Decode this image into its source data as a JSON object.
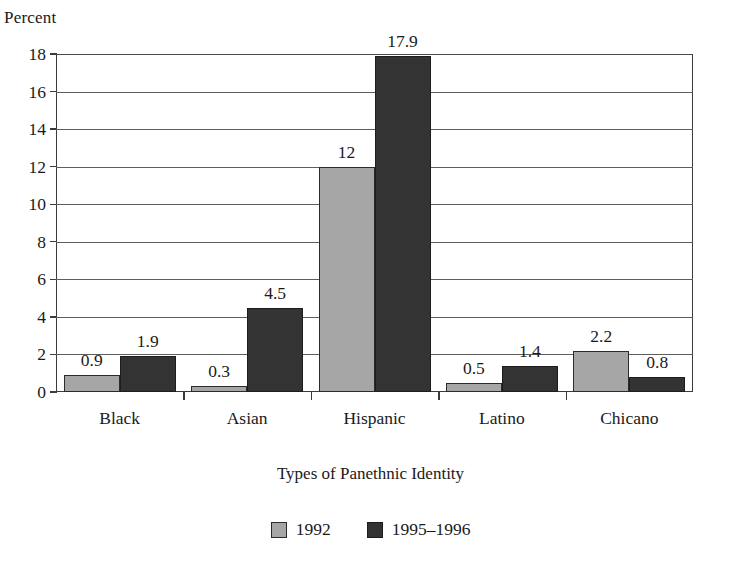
{
  "chart_data": {
    "type": "bar",
    "title": "",
    "xlabel": "Types of Panethnic Identity",
    "ylabel": "Percent",
    "categories": [
      "Black",
      "Asian",
      "Hispanic",
      "Latino",
      "Chicano"
    ],
    "series": [
      {
        "name": "1992",
        "color": "#a6a6a6",
        "values": [
          0.9,
          0.3,
          12,
          0.5,
          2.2
        ],
        "labels": [
          "0.9",
          "0.3",
          "12",
          "0.5",
          "2.2"
        ]
      },
      {
        "name": "1995–1996",
        "color": "#333333",
        "values": [
          1.9,
          4.5,
          17.9,
          1.4,
          0.8
        ],
        "labels": [
          "1.9",
          "4.5",
          "17.9",
          "1.4",
          "0.8"
        ]
      }
    ],
    "ylim": [
      0,
      18
    ],
    "yticks": [
      0,
      2,
      4,
      6,
      8,
      10,
      12,
      14,
      16,
      18
    ],
    "ytick_labels": [
      "0",
      "2",
      "4",
      "6",
      "8",
      "10",
      "12",
      "14",
      "16",
      "18"
    ],
    "grid": true,
    "legend_position": "bottom",
    "value_labels_shown": true
  },
  "axes": {
    "y_title": "Percent",
    "x_title": "Types of Panethnic Identity"
  },
  "legend": {
    "items": [
      {
        "label": "1992",
        "color": "#a6a6a6"
      },
      {
        "label": "1995–1996",
        "color": "#333333"
      }
    ]
  },
  "colors": {
    "series_1992": "#a6a6a6",
    "series_1995_1996": "#333333",
    "gridline": "#5e5e5e",
    "axis": "#3b3b3b",
    "text": "#1a1a1a",
    "background": "#ffffff"
  }
}
